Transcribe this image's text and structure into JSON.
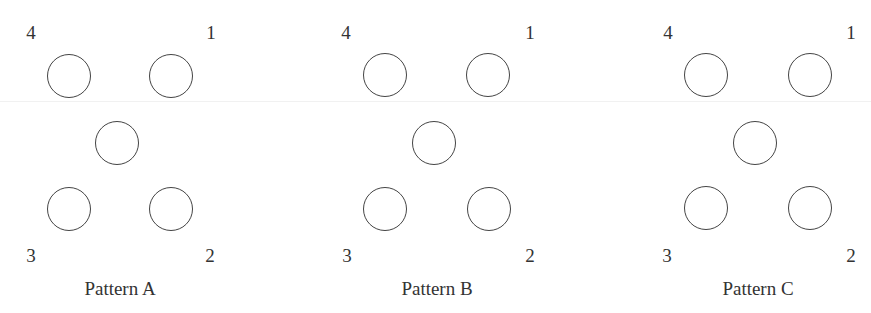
{
  "figure": {
    "patterns": [
      {
        "caption": "Pattern A",
        "labels": {
          "top_left": "4",
          "top_right": "1",
          "bottom_left": "3",
          "bottom_right": "2"
        }
      },
      {
        "caption": "Pattern B",
        "labels": {
          "top_left": "4",
          "top_right": "1",
          "bottom_left": "3",
          "bottom_right": "2"
        }
      },
      {
        "caption": "Pattern C",
        "labels": {
          "top_left": "4",
          "top_right": "1",
          "bottom_left": "3",
          "bottom_right": "2"
        }
      }
    ],
    "colors": {
      "stroke": "#444444",
      "text": "#333333",
      "background": "#ffffff"
    }
  }
}
